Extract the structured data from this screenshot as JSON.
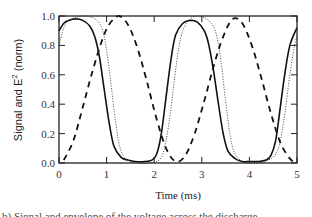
{
  "chart_data": {
    "type": "line",
    "title": "",
    "xlabel": "Time (ms)",
    "ylabel": "Signal and E^2 (norm)",
    "ylabel_parts": {
      "base": "Signal and E",
      "sup": "2",
      "tail": " (norm)"
    },
    "xlim": [
      0,
      5
    ],
    "ylim": [
      0,
      1.0
    ],
    "xticks": [
      "0",
      "1",
      "2",
      "3",
      "4",
      "5"
    ],
    "yticks": [
      "0.0",
      "0.2",
      "0.4",
      "0.6",
      "0.8",
      "1.0"
    ],
    "grid": false,
    "legend": null,
    "series": [
      {
        "name": "solid",
        "style": "solid",
        "x": [
          0.0,
          0.1,
          0.2,
          0.35,
          0.5,
          0.65,
          0.75,
          0.85,
          0.95,
          1.05,
          1.15,
          1.3,
          1.45,
          1.6,
          1.8,
          1.95,
          2.05,
          2.15,
          2.25,
          2.35,
          2.45,
          2.6,
          2.75,
          2.9,
          3.05,
          3.15,
          3.25,
          3.35,
          3.45,
          3.55,
          3.7,
          3.85,
          4.0,
          4.2,
          4.35,
          4.45,
          4.55,
          4.65,
          4.75,
          4.85,
          5.0
        ],
        "y": [
          0.9,
          0.95,
          0.97,
          0.98,
          0.97,
          0.93,
          0.86,
          0.72,
          0.5,
          0.28,
          0.12,
          0.04,
          0.02,
          0.01,
          0.01,
          0.02,
          0.06,
          0.2,
          0.45,
          0.7,
          0.87,
          0.95,
          0.97,
          0.96,
          0.9,
          0.8,
          0.62,
          0.4,
          0.2,
          0.08,
          0.03,
          0.01,
          0.01,
          0.01,
          0.02,
          0.05,
          0.15,
          0.38,
          0.62,
          0.8,
          0.92
        ]
      },
      {
        "name": "dotted",
        "style": "dotted",
        "x": [
          0.0,
          0.1,
          0.2,
          0.35,
          0.5,
          0.7,
          0.85,
          0.95,
          1.05,
          1.15,
          1.25,
          1.35,
          1.5,
          1.7,
          1.9,
          2.1,
          2.2,
          2.3,
          2.4,
          2.5,
          2.6,
          2.75,
          2.9,
          3.05,
          3.2,
          3.3,
          3.4,
          3.5,
          3.6,
          3.7,
          3.85,
          4.0,
          4.2,
          4.4,
          4.55,
          4.65,
          4.75,
          4.85,
          4.95,
          5.0
        ],
        "y": [
          0.8,
          0.92,
          0.97,
          0.99,
          1.0,
          0.99,
          0.95,
          0.86,
          0.65,
          0.38,
          0.15,
          0.05,
          0.01,
          0.0,
          0.0,
          0.02,
          0.08,
          0.25,
          0.5,
          0.75,
          0.9,
          0.98,
          1.0,
          0.99,
          0.95,
          0.88,
          0.7,
          0.42,
          0.18,
          0.06,
          0.01,
          0.0,
          0.0,
          0.02,
          0.06,
          0.15,
          0.35,
          0.6,
          0.8,
          0.86
        ]
      },
      {
        "name": "dashed",
        "style": "dashed",
        "x": [
          0.1,
          0.3,
          0.5,
          0.7,
          0.9,
          1.05,
          1.25,
          1.45,
          1.65,
          1.85,
          2.05,
          2.25,
          2.45,
          2.65,
          2.85,
          3.05,
          3.25,
          3.45,
          3.65,
          3.85,
          4.05,
          4.25,
          4.45,
          4.65,
          4.85,
          5.0
        ],
        "y": [
          0.02,
          0.15,
          0.38,
          0.62,
          0.83,
          0.94,
          1.0,
          0.94,
          0.78,
          0.55,
          0.3,
          0.1,
          0.01,
          0.05,
          0.2,
          0.42,
          0.66,
          0.86,
          0.98,
          0.95,
          0.8,
          0.58,
          0.34,
          0.14,
          0.03,
          0.0
        ]
      }
    ]
  },
  "caption": "b) Signal and envelope of the voltage across the discharge..."
}
